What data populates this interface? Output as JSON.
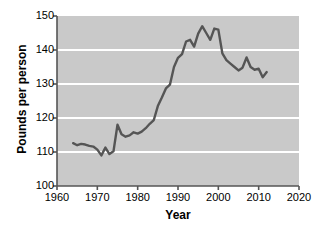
{
  "chart_data": {
    "type": "line",
    "title": "",
    "xlabel": "Year",
    "ylabel": "Pounds per person",
    "xlim": [
      1960,
      2020
    ],
    "ylim": [
      100,
      150
    ],
    "xticks": [
      1960,
      1970,
      1980,
      1990,
      2000,
      2010,
      2020
    ],
    "yticks": [
      100,
      110,
      120,
      130,
      140,
      150
    ],
    "grid": "horizontal",
    "legend": "none",
    "colors": {
      "plot_background": "#c9c9c9",
      "gridline": "#ffffff",
      "line": "#555555",
      "axis": "#555555",
      "text": "#000000",
      "page_background": "#ffffff"
    },
    "series": [
      {
        "name": "Pounds per person",
        "x": [
          1964,
          1965,
          1966,
          1967,
          1968,
          1969,
          1970,
          1971,
          1972,
          1973,
          1974,
          1975,
          1976,
          1977,
          1978,
          1979,
          1980,
          1981,
          1982,
          1983,
          1984,
          1985,
          1986,
          1987,
          1988,
          1989,
          1990,
          1991,
          1992,
          1993,
          1994,
          1995,
          1996,
          1997,
          1998,
          1999,
          2000,
          2001,
          2002,
          2003,
          2004,
          2005,
          2006,
          2007,
          2008,
          2009,
          2010,
          2011,
          2012
        ],
        "values": [
          112.6,
          112.0,
          112.4,
          112.2,
          111.8,
          111.6,
          110.7,
          109.0,
          111.3,
          109.4,
          110.2,
          118.0,
          115.2,
          114.5,
          114.9,
          115.8,
          115.4,
          116.0,
          117.0,
          118.3,
          119.4,
          123.5,
          126.0,
          128.7,
          129.8,
          135.0,
          137.7,
          138.8,
          142.5,
          143.0,
          141.0,
          144.8,
          147.0,
          145.0,
          143.0,
          146.3,
          146.0,
          139.0,
          137.0,
          136.0,
          135.0,
          134.0,
          134.8,
          137.8,
          135.0,
          134.2,
          134.5,
          132.0,
          133.5
        ]
      }
    ]
  },
  "axes": {
    "x_title": "Year",
    "y_title": "Pounds per person",
    "x_tick_labels": [
      "1960",
      "1970",
      "1980",
      "1990",
      "2000",
      "2010",
      "2020"
    ],
    "y_tick_labels": [
      "100",
      "110",
      "120",
      "130",
      "140",
      "150"
    ]
  }
}
